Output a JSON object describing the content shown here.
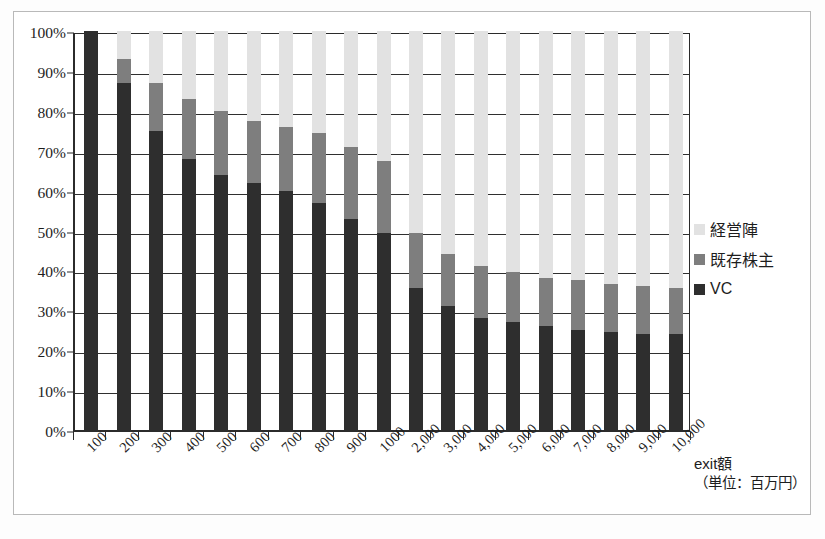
{
  "chart_data": {
    "type": "bar",
    "subtype": "stacked-100-percent",
    "title": "",
    "xlabel": "exit額（単位：百万円）",
    "ylabel": "",
    "ylim": [
      0,
      100
    ],
    "yticks": [
      "0%",
      "10%",
      "20%",
      "30%",
      "40%",
      "50%",
      "60%",
      "70%",
      "80%",
      "90%",
      "100%"
    ],
    "grid": true,
    "legend_position": "right",
    "categories": [
      "100",
      "200",
      "300",
      "400",
      "500",
      "600",
      "700",
      "800",
      "900",
      "1000",
      "2,000",
      "3,000",
      "4,000",
      "5,000",
      "6,000",
      "7,000",
      "8,000",
      "9,000",
      "10,000"
    ],
    "series": [
      {
        "name": "VC",
        "color": "#2e2e2e",
        "values": [
          100,
          87,
          75,
          68,
          64,
          62,
          60,
          57,
          53,
          49.5,
          35.5,
          31,
          28,
          27,
          26,
          25,
          24.5,
          24,
          24
        ]
      },
      {
        "name": "既存株主",
        "color": "#7e7e7e",
        "values": [
          0,
          6,
          12,
          15,
          16,
          15.5,
          16,
          17.5,
          18,
          18,
          14,
          13,
          13,
          12.5,
          12,
          12.5,
          12,
          12,
          11.5
        ]
      },
      {
        "name": "経営陣",
        "color": "#e2e2e2",
        "values": [
          0,
          7,
          13,
          17,
          20,
          22.5,
          24,
          25.5,
          29,
          32.5,
          50.5,
          56,
          59,
          60.5,
          62,
          62.5,
          63.5,
          64,
          64.5
        ]
      }
    ],
    "cumulative_tops": {
      "vc": [
        100,
        87,
        75,
        68,
        64,
        62,
        60,
        57,
        53,
        49.5,
        35.5,
        31,
        28,
        27,
        26,
        25,
        24.5,
        24,
        24
      ],
      "vc_plus_existing": [
        100,
        93,
        87,
        83,
        80,
        77.5,
        76,
        74.5,
        71,
        67.5,
        49.5,
        44,
        41,
        39.5,
        38,
        37.5,
        36.5,
        36,
        35.5
      ]
    }
  },
  "axis": {
    "x_title_line1": "exit額",
    "x_title_line2": "（単位：百万円）"
  },
  "legend": {
    "items": [
      {
        "label": "経営陣",
        "swatch": "#e2e2e2"
      },
      {
        "label": "既存株主",
        "swatch": "#7e7e7e"
      },
      {
        "label": "VC",
        "swatch": "#2e2e2e"
      }
    ]
  }
}
